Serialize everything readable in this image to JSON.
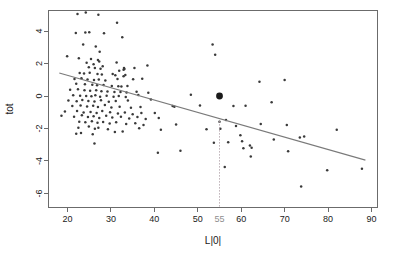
{
  "chart_data": {
    "type": "scatter",
    "title": "",
    "xlabel": "L|0|",
    "ylabel": "tot",
    "xlim": [
      15.5,
      91.5
    ],
    "ylim": [
      -6.9,
      5.3
    ],
    "grid": false,
    "legend": null,
    "xticks": [
      20,
      30,
      40,
      50,
      60,
      70,
      80,
      90
    ],
    "xtick_labels": [
      "20",
      "30",
      "40",
      "50",
      "60",
      "70",
      "80",
      "90"
    ],
    "yticks": [
      4,
      2,
      0,
      -2,
      -4,
      -6
    ],
    "ytick_labels": [
      "4",
      "2",
      "0",
      "-2",
      "-4",
      "-6"
    ],
    "extra_xtick": {
      "value": 55,
      "label": "55",
      "color": "#8e8e8e"
    },
    "annotations": [
      {
        "kind": "vertical-dotted-line",
        "x": 55,
        "y_from": -1.55,
        "y_to": -6.9,
        "color": "#b0a0a8"
      },
      {
        "kind": "highlighted-point",
        "x": 55,
        "y": 0.0,
        "color": "#1a1a1a",
        "radius": 3.4
      },
      {
        "kind": "regression-line",
        "x_from": 18.1,
        "y_from": 1.42,
        "x_to": 88.6,
        "y_to": -3.95,
        "color": "#7a7a7a"
      }
    ],
    "point_color": "#3a3a3a",
    "point_radius": 1.25,
    "series": [
      {
        "name": "observations",
        "points": [
          [
            22.3,
            5.05
          ],
          [
            24.2,
            5.15
          ],
          [
            27.1,
            5.0
          ],
          [
            21.9,
            3.88
          ],
          [
            24.1,
            3.92
          ],
          [
            25.0,
            3.93
          ],
          [
            28.4,
            3.86
          ],
          [
            32.6,
            3.62
          ],
          [
            31.4,
            4.52
          ],
          [
            23.6,
            3.18
          ],
          [
            26.5,
            3.05
          ],
          [
            27.4,
            2.72
          ],
          [
            53.4,
            3.18
          ],
          [
            19.9,
            2.45
          ],
          [
            22.6,
            2.32
          ],
          [
            25.4,
            2.28
          ],
          [
            27.0,
            2.22
          ],
          [
            54.0,
            2.55
          ],
          [
            24.4,
            2.05
          ],
          [
            26.0,
            1.95
          ],
          [
            27.3,
            2.12
          ],
          [
            31.3,
            2.06
          ],
          [
            33.0,
            1.72
          ],
          [
            24.9,
            1.78
          ],
          [
            26.3,
            1.72
          ],
          [
            27.6,
            1.68
          ],
          [
            28.1,
            1.84
          ],
          [
            31.9,
            1.55
          ],
          [
            32.9,
            1.62
          ],
          [
            33.1,
            1.66
          ],
          [
            35.4,
            1.72
          ],
          [
            38.4,
            1.88
          ],
          [
            22.8,
            1.42
          ],
          [
            23.8,
            1.38
          ],
          [
            25.1,
            1.44
          ],
          [
            26.9,
            1.35
          ],
          [
            27.9,
            1.32
          ],
          [
            30.4,
            1.35
          ],
          [
            31.0,
            1.28
          ],
          [
            32.9,
            1.22
          ],
          [
            33.3,
            1.3
          ],
          [
            21.6,
            1.05
          ],
          [
            23.2,
            1.1
          ],
          [
            24.6,
            1.02
          ],
          [
            26.1,
            0.98
          ],
          [
            27.2,
            1.02
          ],
          [
            28.7,
            0.95
          ],
          [
            31.5,
            1.05
          ],
          [
            35.1,
            1.04
          ],
          [
            37.2,
            1.06
          ],
          [
            22.0,
            0.75
          ],
          [
            24.0,
            0.72
          ],
          [
            25.7,
            0.7
          ],
          [
            26.8,
            0.66
          ],
          [
            28.3,
            0.68
          ],
          [
            30.2,
            0.62
          ],
          [
            31.7,
            0.6
          ],
          [
            32.4,
            0.58
          ],
          [
            33.8,
            0.62
          ],
          [
            20.6,
            0.38
          ],
          [
            22.4,
            0.42
          ],
          [
            23.9,
            0.36
          ],
          [
            25.2,
            0.33
          ],
          [
            26.6,
            0.35
          ],
          [
            27.8,
            0.3
          ],
          [
            29.2,
            0.28
          ],
          [
            30.8,
            0.25
          ],
          [
            32.2,
            0.24
          ],
          [
            33.6,
            0.22
          ],
          [
            35.9,
            0.26
          ],
          [
            38.6,
            0.2
          ],
          [
            21.3,
            0.05
          ],
          [
            22.9,
            0.02
          ],
          [
            24.3,
            0.0
          ],
          [
            25.5,
            -0.02
          ],
          [
            26.4,
            0.04
          ],
          [
            27.5,
            -0.05
          ],
          [
            29.0,
            0.02
          ],
          [
            30.6,
            -0.04
          ],
          [
            31.8,
            0.0
          ],
          [
            33.4,
            -0.06
          ],
          [
            36.3,
            0.06
          ],
          [
            48.4,
            0.08
          ],
          [
            20.2,
            -0.28
          ],
          [
            22.1,
            -0.32
          ],
          [
            23.4,
            -0.25
          ],
          [
            24.8,
            -0.3
          ],
          [
            26.2,
            -0.34
          ],
          [
            27.7,
            -0.26
          ],
          [
            29.5,
            -0.35
          ],
          [
            31.1,
            -0.3
          ],
          [
            33.9,
            -0.28
          ],
          [
            39.2,
            -0.22
          ],
          [
            44.2,
            -0.62
          ],
          [
            50.5,
            -0.58
          ],
          [
            21.1,
            -0.62
          ],
          [
            23.0,
            -0.58
          ],
          [
            24.5,
            -0.65
          ],
          [
            25.9,
            -0.6
          ],
          [
            27.0,
            -0.68
          ],
          [
            28.6,
            -0.55
          ],
          [
            30.1,
            -0.7
          ],
          [
            32.0,
            -0.66
          ],
          [
            34.6,
            -0.72
          ],
          [
            36.8,
            -0.68
          ],
          [
            44.6,
            -0.66
          ],
          [
            58.2,
            -0.62
          ],
          [
            61.0,
            -0.6
          ],
          [
            19.4,
            -0.95
          ],
          [
            22.2,
            -0.92
          ],
          [
            23.7,
            -1.02
          ],
          [
            25.3,
            -0.98
          ],
          [
            26.7,
            -1.05
          ],
          [
            28.0,
            -0.92
          ],
          [
            29.8,
            -1.0
          ],
          [
            31.6,
            -1.08
          ],
          [
            33.2,
            -1.02
          ],
          [
            35.0,
            -1.12
          ],
          [
            37.0,
            -1.05
          ],
          [
            40.1,
            -1.04
          ],
          [
            18.6,
            -1.22
          ],
          [
            21.5,
            -1.28
          ],
          [
            23.3,
            -1.18
          ],
          [
            24.7,
            -1.3
          ],
          [
            26.0,
            -1.25
          ],
          [
            27.3,
            -1.35
          ],
          [
            28.9,
            -1.22
          ],
          [
            30.3,
            -1.32
          ],
          [
            32.3,
            -1.28
          ],
          [
            34.2,
            -1.38
          ],
          [
            36.1,
            -1.3
          ],
          [
            38.0,
            -1.42
          ],
          [
            41.0,
            -1.35
          ],
          [
            22.7,
            -1.58
          ],
          [
            24.1,
            -1.62
          ],
          [
            25.6,
            -1.55
          ],
          [
            26.9,
            -1.65
          ],
          [
            28.2,
            -1.6
          ],
          [
            29.7,
            -1.7
          ],
          [
            31.2,
            -1.62
          ],
          [
            33.5,
            -1.72
          ],
          [
            35.6,
            -1.68
          ],
          [
            37.5,
            -1.78
          ],
          [
            45.0,
            -1.75
          ],
          [
            55.0,
            -1.58
          ],
          [
            56.5,
            -1.48
          ],
          [
            58.8,
            -1.85
          ],
          [
            22.5,
            -1.95
          ],
          [
            24.9,
            -1.88
          ],
          [
            26.3,
            -2.02
          ],
          [
            27.1,
            -1.96
          ],
          [
            29.3,
            -2.05
          ],
          [
            32.7,
            -2.18
          ],
          [
            36.5,
            -1.98
          ],
          [
            41.5,
            -2.08
          ],
          [
            52.0,
            -2.05
          ],
          [
            55.2,
            -2.02
          ],
          [
            64.5,
            -1.72
          ],
          [
            70.5,
            -1.78
          ],
          [
            82.0,
            -2.08
          ],
          [
            22.0,
            -2.32
          ],
          [
            23.1,
            -2.28
          ],
          [
            25.8,
            -2.35
          ],
          [
            30.9,
            -2.22
          ],
          [
            59.8,
            -2.42
          ],
          [
            73.5,
            -2.55
          ],
          [
            74.5,
            -2.5
          ],
          [
            26.2,
            -2.92
          ],
          [
            53.7,
            -2.88
          ],
          [
            57.0,
            -2.85
          ],
          [
            60.2,
            -2.78
          ],
          [
            67.5,
            -2.68
          ],
          [
            62.0,
            -3.05
          ],
          [
            60.5,
            -3.22
          ],
          [
            62.4,
            -3.18
          ],
          [
            40.8,
            -3.5
          ],
          [
            46.0,
            -3.38
          ],
          [
            70.8,
            -3.4
          ],
          [
            62.2,
            -3.72
          ],
          [
            56.2,
            -4.38
          ],
          [
            79.8,
            -4.58
          ],
          [
            87.8,
            -4.48
          ],
          [
            73.8,
            -5.58
          ],
          [
            70.0,
            0.98
          ],
          [
            64.2,
            0.88
          ],
          [
            67.0,
            -0.38
          ]
        ]
      }
    ]
  },
  "geometry": {
    "plot_left": 48,
    "plot_right": 378,
    "plot_top": 10,
    "plot_bottom": 208
  }
}
